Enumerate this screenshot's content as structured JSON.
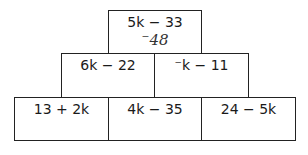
{
  "pyramid": {
    "top": {
      "expression": "5k − 33",
      "answer": "⁻48"
    },
    "middle": [
      {
        "expression": "6k − 22"
      },
      {
        "expression": "⁻k − 11"
      }
    ],
    "bottom": [
      {
        "expression": "13 + 2k"
      },
      {
        "expression": "4k − 35"
      },
      {
        "expression": "24 − 5k"
      }
    ]
  }
}
